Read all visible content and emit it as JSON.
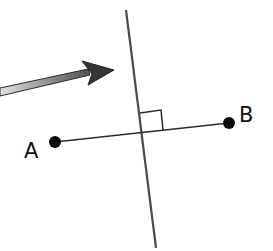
{
  "diagram": {
    "points": [
      {
        "id": "A",
        "label": "A"
      },
      {
        "id": "B",
        "label": "B"
      }
    ],
    "segment": {
      "from": "A",
      "to": "B"
    },
    "perpendicular_line": {
      "relation": "perpendicular to AB",
      "right_angle_marker": true
    },
    "arrow": {
      "direction": "points toward the perpendicular line",
      "style": "gradient-gray"
    },
    "colors": {
      "line": "#444444",
      "point": "#0a0a0a",
      "arrow_dark": "#3a3a3a",
      "arrow_light": "#d8d8d8"
    }
  }
}
